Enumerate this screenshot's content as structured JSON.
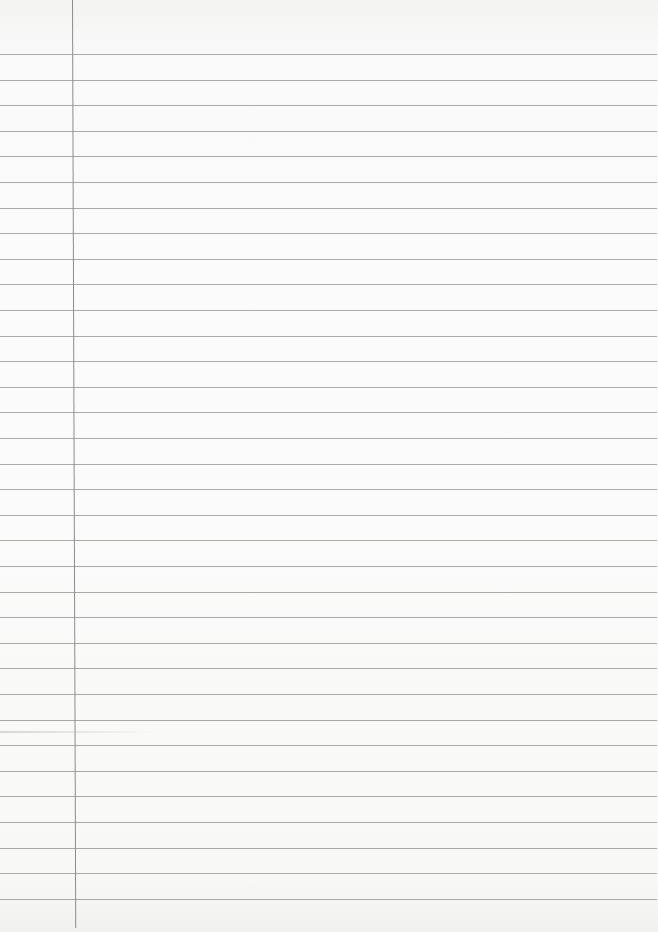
{
  "page": {
    "type": "lined notebook paper",
    "content_text": "",
    "paper_color": "#f8f8f7",
    "rule_color": "#9a9a9a",
    "margin_line_color": "#8c8c8c",
    "rule_count": 34,
    "first_rule_y": 54,
    "rule_spacing_px": 25.6,
    "margin_line_x": 72
  }
}
